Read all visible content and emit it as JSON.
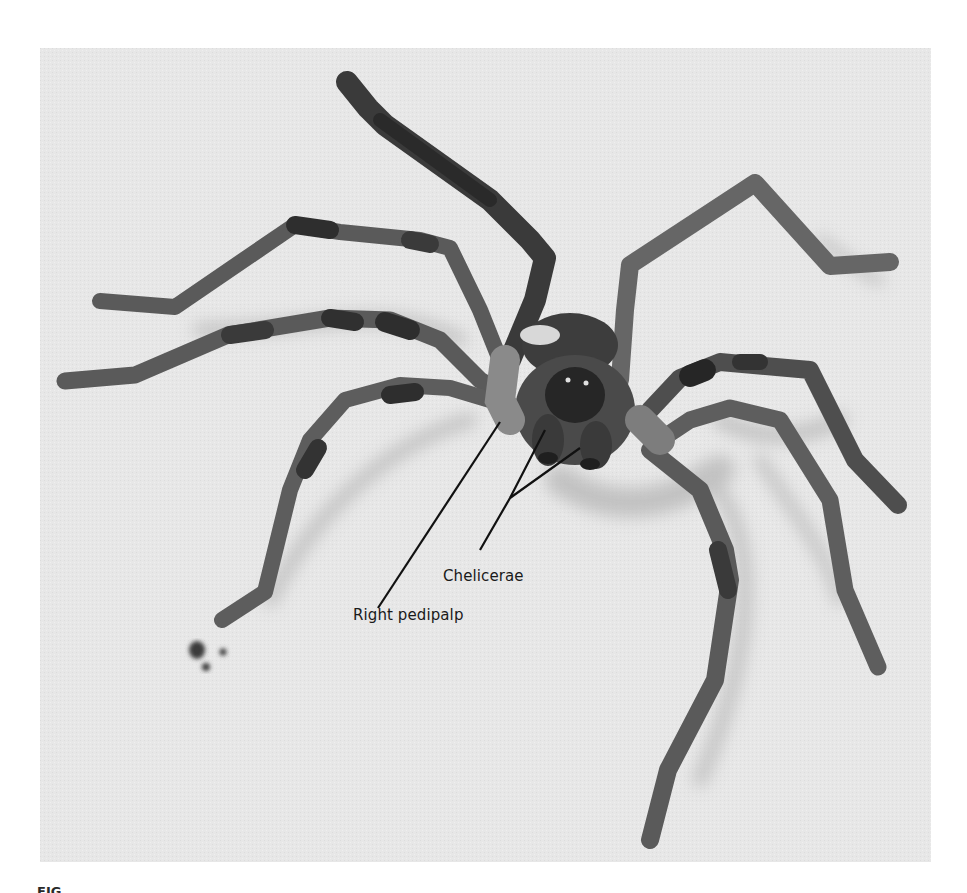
{
  "figure": {
    "background_color": "#e6e6e6",
    "labels": [
      {
        "id": "chelicerae",
        "text": "Chelicerae"
      },
      {
        "id": "right_pedipalp",
        "text": "Right pedipalp"
      }
    ],
    "caption_fragment": "FIG."
  }
}
